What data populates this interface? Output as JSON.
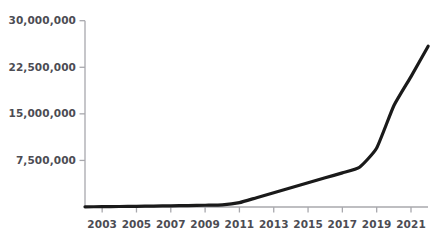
{
  "chart_data": {
    "type": "line",
    "title": "",
    "subtitle": "",
    "xlabel": "",
    "ylabel": "",
    "grid": false,
    "legend": null,
    "legend_position": "none",
    "line_color": "#1a1a1a",
    "axis_color": "#a8a8ad",
    "tick_label_color": "#4c4c53",
    "xlim": [
      2002,
      2022
    ],
    "ylim": [
      0,
      30000000
    ],
    "y_ticks": [
      7500000,
      15000000,
      22500000,
      30000000
    ],
    "y_tick_labels": [
      "7,500,000",
      "15,000,000",
      "22,500,000",
      "30,000,000"
    ],
    "x_ticks": [
      2003,
      2005,
      2007,
      2009,
      2011,
      2013,
      2015,
      2017,
      2019,
      2021
    ],
    "x_tick_labels": [
      "2003",
      "2005",
      "2007",
      "2009",
      "2011",
      "2013",
      "2015",
      "2017",
      "2019",
      "2021"
    ],
    "x": [
      2002,
      2003,
      2004,
      2005,
      2006,
      2007,
      2008,
      2009,
      2010,
      2011,
      2012,
      2013,
      2014,
      2015,
      2016,
      2017,
      2018,
      2019,
      2020,
      2021,
      2022
    ],
    "values": [
      30000,
      50000,
      80000,
      110000,
      150000,
      190000,
      230000,
      280000,
      330000,
      700000,
      1500000,
      2300000,
      3100000,
      3900000,
      4700000,
      5500000,
      6400000,
      9500000,
      16300000,
      21000000,
      25900000
    ],
    "series": [
      {
        "name": "",
        "values": [
          30000,
          50000,
          80000,
          110000,
          150000,
          190000,
          230000,
          280000,
          330000,
          700000,
          1500000,
          2300000,
          3100000,
          3900000,
          4700000,
          5500000,
          6400000,
          9500000,
          16300000,
          21000000,
          25900000
        ]
      }
    ]
  }
}
